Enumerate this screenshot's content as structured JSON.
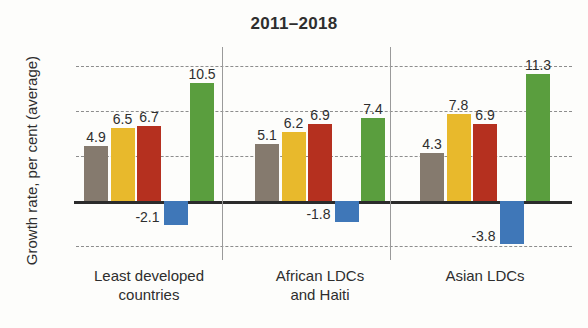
{
  "chart_data": {
    "type": "bar",
    "title": "2011–2018",
    "xlabel": "",
    "ylabel": "Growth rate, per cent (average)",
    "ylim": [
      -5.2,
      13.0
    ],
    "yticks": [
      12,
      8,
      4,
      0,
      -4
    ],
    "ytick_labels": [
      "12",
      "8",
      "4",
      "0",
      "-4"
    ],
    "grid": true,
    "legend": "none",
    "categories": [
      "Least developed countries",
      "African LDCs and Haiti",
      "Asian LDCs"
    ],
    "category_lines": [
      [
        "Least developed",
        "countries"
      ],
      [
        "African LDCs",
        "and Haiti"
      ],
      [
        "Asian LDCs"
      ]
    ],
    "series": [
      {
        "name": "series-1",
        "color": "#857a6e",
        "values": [
          4.9,
          5.1,
          4.3
        ],
        "labels": [
          "4.9",
          "5.1",
          "4.3"
        ]
      },
      {
        "name": "series-2",
        "color": "#e8b92c",
        "values": [
          6.5,
          6.2,
          7.8
        ],
        "labels": [
          "6.5",
          "6.2",
          "7.8"
        ]
      },
      {
        "name": "series-3",
        "color": "#b5301f",
        "values": [
          6.7,
          6.9,
          6.9
        ],
        "labels": [
          "6.7",
          "6.9",
          "6.9"
        ]
      },
      {
        "name": "series-4",
        "color": "#3f77b8",
        "values": [
          -2.1,
          -1.8,
          -3.8
        ],
        "labels": [
          "-2.1",
          "-1.8",
          "-3.8"
        ]
      },
      {
        "name": "series-5",
        "color": "#5a9e3e",
        "values": [
          10.5,
          7.4,
          11.3
        ],
        "labels": [
          "10.5",
          "7.4",
          "11.3"
        ]
      }
    ],
    "colors": {
      "series_1_taupe": "#857a6e",
      "series_2_yellow": "#e8b92c",
      "series_3_red": "#b5301f",
      "series_4_blue": "#3f77b8",
      "series_5_green": "#5a9e3e",
      "axis": "#2b2b2b",
      "grid": "#8d8d8d",
      "background": "#fdfdfb"
    }
  }
}
